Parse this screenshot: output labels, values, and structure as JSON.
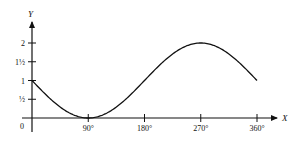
{
  "chart_data": {
    "type": "line",
    "title": "",
    "xlabel": "X",
    "ylabel": "Y",
    "origin_label": "0",
    "x_ticks": [
      {
        "value": 90,
        "label": "90°"
      },
      {
        "value": 180,
        "label": "180°"
      },
      {
        "value": 270,
        "label": "270°"
      },
      {
        "value": 360,
        "label": "360°"
      }
    ],
    "y_ticks": [
      {
        "value": 0.5,
        "label": "½"
      },
      {
        "value": 1,
        "label": "1"
      },
      {
        "value": 1.5,
        "label": "1½"
      },
      {
        "value": 2,
        "label": "2"
      }
    ],
    "xlim": [
      0,
      360
    ],
    "ylim": [
      0,
      2.3
    ],
    "grid": false,
    "legend": null,
    "function": "y = 1 - sin(x)",
    "series": [
      {
        "name": "y = 1 - sin x",
        "x": [
          0,
          30,
          45,
          60,
          90,
          120,
          135,
          150,
          180,
          210,
          225,
          240,
          270,
          300,
          315,
          330,
          360
        ],
        "values": [
          1,
          0.5,
          0.29,
          0.13,
          0,
          0.13,
          0.29,
          0.5,
          1,
          1.5,
          1.71,
          1.87,
          2,
          1.87,
          1.71,
          1.5,
          1
        ]
      }
    ]
  }
}
